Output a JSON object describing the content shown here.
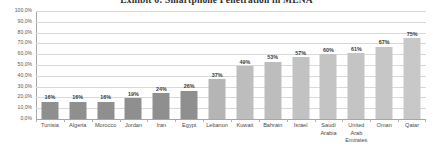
{
  "chart_data": {
    "type": "bar",
    "title": "Exhibit 6: Smartphone Penetration in MENA",
    "xlabel": "",
    "ylabel": "",
    "ylim": [
      0,
      100
    ],
    "grid": true,
    "legend": "none",
    "ytick_labels": [
      "100,0%",
      "90,0%",
      "80,0%",
      "70,0%",
      "60,0%",
      "50,0%",
      "40,0%",
      "30,0%",
      "20,0%",
      "10,0%",
      "0,0%"
    ],
    "ytick_values": [
      100,
      90,
      80,
      70,
      60,
      50,
      40,
      30,
      20,
      10,
      0
    ],
    "categories": [
      "Tunisia",
      "Algeria",
      "Morocco",
      "Jordan",
      "Iran",
      "Egypt",
      "Lebanon",
      "Kuwait",
      "Bahrain",
      "Israel",
      "Saudi Arabia",
      "United Arab Emirates",
      "Oman",
      "Qatar"
    ],
    "values": [
      16,
      16,
      16,
      19,
      24,
      26,
      37,
      49,
      53,
      57,
      60,
      61,
      67,
      75
    ],
    "data_labels": [
      "16%",
      "16%",
      "16%",
      "19%",
      "24%",
      "26%",
      "37%",
      "49%",
      "53%",
      "57%",
      "60%",
      "61%",
      "67%",
      "75%"
    ],
    "bar_colors": [
      "#8f8f8f",
      "#8f8f8f",
      "#8f8f8f",
      "#8f8f8f",
      "#8f8f8f",
      "#8f8f8f",
      "#b5b5b5",
      "#bdbdbd",
      "#bdbdbd",
      "#c2c2c2",
      "#c4c4c4",
      "#c4c4c4",
      "#c6c6c6",
      "#c8c8c8"
    ],
    "colors": {
      "gridline": "#d9d9d9",
      "axis": "#a6a6a6",
      "bar_dark": "#8f8f8f",
      "bar_light": "#c4c4c4",
      "text": "#4a4a4a",
      "background": "#ffffff"
    }
  }
}
